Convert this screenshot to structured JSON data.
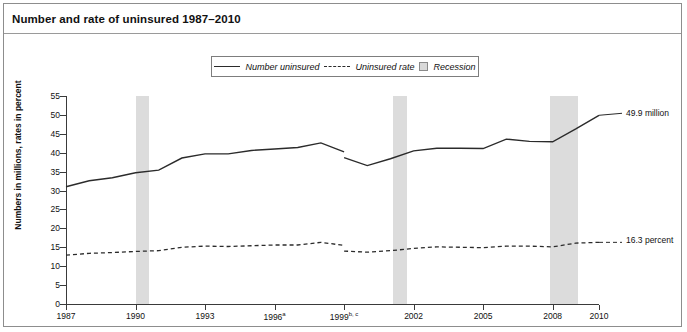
{
  "title": "Number and rate of uninsured 1987–2010",
  "legend": {
    "items": [
      {
        "name": "number-uninsured",
        "label": "Number uninsured",
        "style": "solid",
        "color": "#2b2b2b"
      },
      {
        "name": "uninsured-rate",
        "label": "Uninsured rate",
        "style": "dashed",
        "color": "#2b2b2b"
      },
      {
        "name": "recession",
        "label": "Recession",
        "style": "swatch",
        "color": "#d9d9d9"
      }
    ]
  },
  "annotations": [
    {
      "name": "number-uninsured-endpoint",
      "text": "49.9 million"
    },
    {
      "name": "uninsured-rate-endpoint",
      "text": "16.3 percent"
    }
  ],
  "chart_data": {
    "type": "line",
    "title": "Number and rate of uninsured 1987–2010",
    "xlabel": "",
    "ylabel": "Numbers in millions, rates in percent",
    "ylim": [
      0,
      55
    ],
    "xlim": [
      1987,
      2010
    ],
    "yticks": [
      0,
      5,
      10,
      15,
      20,
      25,
      30,
      35,
      40,
      45,
      50,
      55
    ],
    "xticks": [
      1987,
      1990,
      1993,
      1996,
      1999,
      2002,
      2005,
      2008,
      2010
    ],
    "xtick_labels": [
      "1987",
      "1990",
      "1993",
      "1996",
      "1999",
      "2002",
      "2005",
      "2008",
      "2010"
    ],
    "xtick_superscripts": [
      "",
      "",
      "",
      "a",
      "b, c",
      "",
      "",
      "",
      ""
    ],
    "grid": false,
    "legend_position": "top-center",
    "series": [
      {
        "name": "Number uninsured",
        "style": "solid",
        "units": "millions",
        "x": [
          1987,
          1988,
          1989,
          1990,
          1991,
          1992,
          1993,
          1994,
          1995,
          1996,
          1997,
          1998,
          1999,
          1999,
          2000,
          2001,
          2002,
          2003,
          2004,
          2005,
          2006,
          2007,
          2008,
          2009,
          2010
        ],
        "values": [
          31.0,
          32.6,
          33.4,
          34.7,
          35.4,
          38.6,
          39.7,
          39.7,
          40.6,
          41.0,
          41.4,
          42.6,
          40.2,
          38.7,
          36.6,
          38.4,
          40.5,
          41.2,
          41.2,
          41.1,
          43.6,
          43.0,
          42.9,
          46.3,
          49.9
        ],
        "break_after_index": 12,
        "endpoint_label": "49.9 million"
      },
      {
        "name": "Uninsured rate",
        "style": "dashed",
        "units": "percent",
        "x": [
          1987,
          1988,
          1989,
          1990,
          1991,
          1992,
          1993,
          1994,
          1995,
          1996,
          1997,
          1998,
          1999,
          1999,
          2000,
          2001,
          2002,
          2003,
          2004,
          2005,
          2006,
          2007,
          2008,
          2009,
          2010
        ],
        "values": [
          12.9,
          13.4,
          13.6,
          13.9,
          14.1,
          15.0,
          15.3,
          15.2,
          15.4,
          15.6,
          15.6,
          16.3,
          15.5,
          14.0,
          13.7,
          14.1,
          14.7,
          15.1,
          15.0,
          14.9,
          15.3,
          15.3,
          15.1,
          16.1,
          16.3
        ],
        "break_after_index": 12,
        "endpoint_label": "16.3 percent"
      }
    ],
    "shaded_regions": [
      {
        "name": "recession-1990",
        "label": "Recession",
        "start": 1990.0,
        "end": 1990.6,
        "color": "#dcdcdc"
      },
      {
        "name": "recession-2001",
        "label": "Recession",
        "start": 2001.1,
        "end": 2001.7,
        "color": "#dcdcdc"
      },
      {
        "name": "recession-2008",
        "label": "Recession",
        "start": 2007.9,
        "end": 2009.1,
        "color": "#dcdcdc"
      }
    ]
  }
}
